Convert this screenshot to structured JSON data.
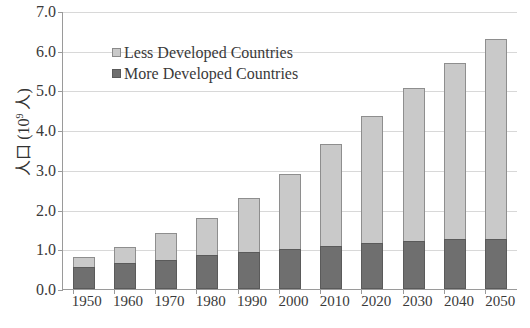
{
  "chart_data": {
    "type": "bar",
    "title": "",
    "subtitle": "",
    "xlabel": "",
    "ylabel": "人口（10⁹人）",
    "ylabel_parts": {
      "prefix": "人口 (10",
      "sup": "9",
      "suffix": " 人)"
    },
    "categories": [
      "1950",
      "1960",
      "1970",
      "1980",
      "1990",
      "2000",
      "2010",
      "2020",
      "2030",
      "2040",
      "2050"
    ],
    "series": [
      {
        "name": "More Developed Countries",
        "color": "#6f6f6f",
        "values": [
          0.55,
          0.65,
          0.73,
          0.85,
          0.93,
          1.0,
          1.08,
          1.15,
          1.2,
          1.25,
          1.25
        ]
      },
      {
        "name": "Less Developed Countries",
        "color": "#c9c9c9",
        "values": [
          0.25,
          0.4,
          0.67,
          0.95,
          1.37,
          1.9,
          2.57,
          3.2,
          3.85,
          4.45,
          5.05
        ]
      }
    ],
    "totals": [
      0.8,
      1.05,
      1.4,
      1.8,
      2.3,
      2.9,
      3.65,
      4.35,
      5.05,
      5.7,
      6.3
    ],
    "stacked": true,
    "ylim": [
      0.0,
      7.0
    ],
    "yticks": [
      "7.0",
      "6.0",
      "5.0",
      "4.0",
      "3.0",
      "2.0",
      "1.0",
      "0.0"
    ],
    "ytick_values": [
      7.0,
      6.0,
      5.0,
      4.0,
      3.0,
      2.0,
      1.0,
      0.0
    ],
    "grid": true,
    "legend_position": "upper-left",
    "legend": [
      {
        "label": "Less Developed Countries",
        "color": "#c9c9c9"
      },
      {
        "label": "More Developed Countries",
        "color": "#6f6f6f"
      }
    ],
    "colors": {
      "less_developed": "#c9c9c9",
      "more_developed": "#6f6f6f",
      "grid": "#d8d8d8",
      "axis": "#9a9a9a"
    }
  }
}
